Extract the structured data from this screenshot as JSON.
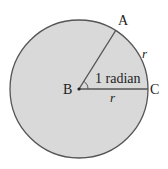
{
  "diagram": {
    "title": "",
    "fill_color": "#d9d9d9",
    "stroke_color": "#555555",
    "labels": {
      "point_a": "A",
      "point_b": "B",
      "point_c": "C",
      "arc_length": "r",
      "radius_label": "r",
      "angle": "1 radian"
    }
  }
}
